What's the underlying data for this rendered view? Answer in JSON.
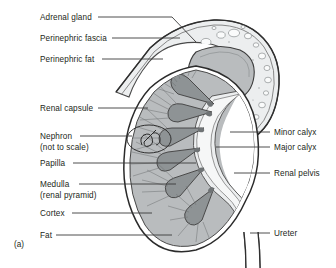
{
  "figure": {
    "caption": "(a)"
  },
  "labels_left": [
    {
      "id": "adrenal-gland",
      "text": "Adrenal gland",
      "x": 40,
      "y": 13,
      "line_x1": 98,
      "line_y1": 17,
      "line_x2": 172,
      "line_y2": 17,
      "elbow_x": 196,
      "elbow_y": 42
    },
    {
      "id": "perinephric-fascia",
      "text": "Perinephric fascia",
      "x": 40,
      "y": 34,
      "line_x1": 112,
      "line_y1": 38,
      "line_x2": 180,
      "line_y2": 38,
      "elbow_x": null,
      "elbow_y": null
    },
    {
      "id": "perinephric-fat",
      "text": "Perinephric fat",
      "x": 40,
      "y": 55,
      "line_x1": 102,
      "line_y1": 59,
      "line_x2": 163,
      "line_y2": 59,
      "elbow_x": null,
      "elbow_y": null
    },
    {
      "id": "renal-capsule",
      "text": "Renal capsule",
      "x": 40,
      "y": 104,
      "line_x1": 98,
      "line_y1": 108,
      "line_x2": 148,
      "line_y2": 108,
      "elbow_x": null,
      "elbow_y": null
    },
    {
      "id": "nephron",
      "text": "Nephron",
      "x": 40,
      "y": 132,
      "line_x1": 80,
      "line_y1": 136,
      "line_x2": 132,
      "line_y2": 136,
      "elbow_x": null,
      "elbow_y": null
    },
    {
      "id": "nephron-note",
      "text": "(not to scale)",
      "x": 40,
      "y": 143,
      "line_x1": null,
      "line_y1": null,
      "line_x2": null,
      "line_y2": null,
      "elbow_x": null,
      "elbow_y": null
    },
    {
      "id": "papilla",
      "text": "Papilla",
      "x": 40,
      "y": 159,
      "line_x1": 73,
      "line_y1": 163,
      "line_x2": 196,
      "line_y2": 163,
      "elbow_x": null,
      "elbow_y": null
    },
    {
      "id": "medulla",
      "text": "Medulla",
      "x": 40,
      "y": 180,
      "line_x1": 79,
      "line_y1": 184,
      "line_x2": 176,
      "line_y2": 184,
      "elbow_x": null,
      "elbow_y": null
    },
    {
      "id": "medulla-note",
      "text": "(renal pyramid)",
      "x": 40,
      "y": 191,
      "line_x1": null,
      "line_y1": null,
      "line_x2": null,
      "line_y2": null,
      "elbow_x": null,
      "elbow_y": null
    },
    {
      "id": "cortex",
      "text": "Cortex",
      "x": 40,
      "y": 209,
      "line_x1": 72,
      "line_y1": 213,
      "line_x2": 152,
      "line_y2": 213,
      "elbow_x": null,
      "elbow_y": null
    },
    {
      "id": "fat",
      "text": "Fat",
      "x": 40,
      "y": 231,
      "line_x1": 56,
      "line_y1": 235,
      "line_x2": 172,
      "line_y2": 235,
      "elbow_x": null,
      "elbow_y": null
    }
  ],
  "labels_right": [
    {
      "id": "minor-calyx",
      "text": "Minor calyx",
      "x": 274,
      "y": 128,
      "line_x1": 230,
      "line_y1": 132,
      "line_x2": 270,
      "line_y2": 132
    },
    {
      "id": "major-calyx",
      "text": "Major calyx",
      "x": 274,
      "y": 143,
      "line_x1": 216,
      "line_y1": 147,
      "line_x2": 270,
      "line_y2": 147
    },
    {
      "id": "renal-pelvis",
      "text": "Renal pelvis",
      "x": 274,
      "y": 169,
      "line_x1": 234,
      "line_y1": 173,
      "line_x2": 270,
      "line_y2": 173
    },
    {
      "id": "ureter",
      "text": "Ureter",
      "x": 274,
      "y": 229,
      "line_x1": 250,
      "line_y1": 233,
      "line_x2": 270,
      "line_y2": 233
    }
  ],
  "colors": {
    "background": "#ffffff",
    "ink": "#231f20",
    "leader_line": "#3a3a3a",
    "cortex_fill": "#b9bcbe",
    "medulla_fill": "#8f9395",
    "pelvis_fill": "#e9ebec",
    "fat_fill": "#eceeef",
    "fascia_line": "#2f2f2f",
    "adrenal_fill": "#b9bcbe",
    "capsule_line": "#2b2b2b",
    "fat_vacuole": "#f7f8f8"
  },
  "structures": [
    {
      "id": "adrenal-gland",
      "name": "Adrenal gland"
    },
    {
      "id": "perinephric-fascia",
      "name": "Perinephric fascia"
    },
    {
      "id": "perinephric-fat",
      "name": "Perinephric fat"
    },
    {
      "id": "renal-capsule",
      "name": "Renal capsule"
    },
    {
      "id": "nephron-inset",
      "name": "Nephron (not to scale)"
    },
    {
      "id": "papilla",
      "name": "Papilla"
    },
    {
      "id": "medulla",
      "name": "Medulla (renal pyramid)"
    },
    {
      "id": "cortex",
      "name": "Cortex"
    },
    {
      "id": "minor-calyx",
      "name": "Minor calyx"
    },
    {
      "id": "major-calyx",
      "name": "Major calyx"
    },
    {
      "id": "renal-pelvis",
      "name": "Renal pelvis"
    },
    {
      "id": "ureter",
      "name": "Ureter"
    },
    {
      "id": "fat",
      "name": "Fat"
    }
  ]
}
